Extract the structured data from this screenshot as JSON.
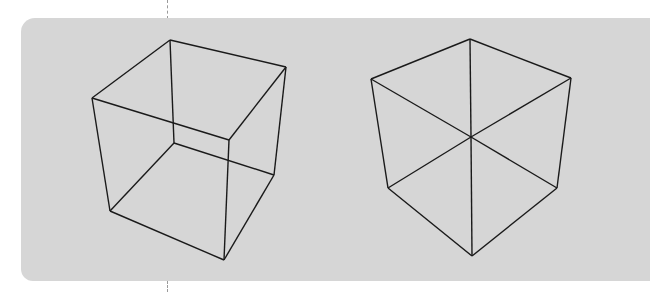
{
  "figure": {
    "background_color": "#d6d6d6",
    "line_color": "#1a1a1a",
    "panels": [
      {
        "name": "cube-perspective",
        "vertices": {
          "top_back": [
            170,
            40
          ],
          "top_right": [
            286,
            67
          ],
          "top_left": [
            92,
            98
          ],
          "top_front": [
            229,
            140
          ],
          "bottom_back": [
            174,
            143
          ],
          "bottom_right": [
            274,
            175
          ],
          "bottom_left": [
            110,
            211
          ],
          "bottom_front": [
            224,
            260
          ]
        }
      },
      {
        "name": "cube-isometric",
        "vertices": {
          "top": [
            470,
            39
          ],
          "upper_left": [
            371,
            79
          ],
          "upper_right": [
            571,
            78
          ],
          "center": [
            471,
            137
          ],
          "lower_left": [
            388,
            188
          ],
          "lower_right": [
            557,
            188
          ],
          "bottom": [
            472,
            256
          ]
        }
      }
    ]
  }
}
